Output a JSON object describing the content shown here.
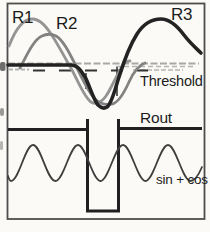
{
  "figure": {
    "type": "waveform-diagram",
    "labels": {
      "r1": "R1",
      "r2": "R2",
      "r3": "R3",
      "threshold": "Threshold",
      "rout": "Rout",
      "sin_cos": "sin + cos"
    },
    "colors": {
      "background": "#fbfaf6",
      "frame": "#4d4d4d",
      "r1_curve": "#949494",
      "r2_curve": "#828282",
      "r3_curve": "#232323",
      "threshold_solid": "#a8a8a8",
      "threshold_hatch": "#b4b4b4",
      "threshold_dashed": "#333333",
      "crossing_tick": "#3a3a3a",
      "rout_wave": "#202020",
      "sin_cos_wave": "#3f3f3f",
      "text": "#1c1c1c",
      "smudge": "#6f6f6f"
    }
  }
}
